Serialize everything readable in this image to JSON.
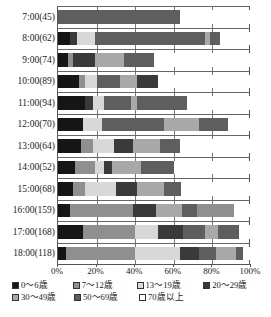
{
  "chart": {
    "type": "bar",
    "title": "",
    "xlabel": "",
    "ylabel": ""
  },
  "axis": {
    "x_ticks": [
      "0%",
      "20%",
      "40%",
      "60%",
      "80%",
      "100%"
    ],
    "x_tick_values": [
      0,
      20,
      40,
      60,
      80,
      100
    ],
    "y_labels": [
      "7:00(45)",
      "8:00(62)",
      "9:00(74)",
      "10:00(89)",
      "11:00(94)",
      "12:00(70)",
      "13:00(64)",
      "14:00(52)",
      "15:00(68)",
      "16:00(159)",
      "17:00(168)",
      "18:00(118)"
    ]
  },
  "legend": {
    "position": "bottom",
    "rows": [
      [
        {
          "label": "0～6歳",
          "color": "#161616"
        },
        {
          "label": "7～12歳",
          "color": "#8f8f8f"
        },
        {
          "label": "13～19歳",
          "color": "#d8d8d8"
        },
        {
          "label": "20～29歳",
          "color": "#3a3a3a"
        }
      ],
      [
        {
          "label": "30～49歳",
          "color": "#a8a8a8"
        },
        {
          "label": "50～69歳",
          "color": "#5e5e5e"
        },
        {
          "label": "70歳以上",
          "color": "#ffffff"
        }
      ]
    ]
  },
  "chart_data": {
    "type": "bar",
    "orientation": "horizontal",
    "stacked": "percent",
    "title": "",
    "xlabel": "",
    "ylabel": "",
    "xlim": [
      0,
      100
    ],
    "grid": true,
    "legend_position": "bottom",
    "categories": [
      "7:00(45)",
      "8:00(62)",
      "9:00(74)",
      "10:00(89)",
      "11:00(94)",
      "12:00(70)",
      "13:00(64)",
      "14:00(52)",
      "15:00(68)",
      "16:00(159)",
      "17:00(168)",
      "18:00(118)"
    ],
    "category_counts": [
      45,
      62,
      74,
      89,
      94,
      70,
      64,
      52,
      68,
      159,
      168,
      118
    ],
    "series": [
      {
        "name": "0～6歳",
        "color": "#161616",
        "values": [
          0,
          5,
          7,
          11,
          14,
          12,
          11,
          8,
          7,
          5,
          12,
          4
        ]
      },
      {
        "name": "7～12歳",
        "color": "#8f8f8f",
        "values": [
          0,
          3,
          0,
          3,
          2,
          0,
          5,
          6,
          5,
          15,
          12,
          23
        ]
      },
      {
        "name": "13～19歳",
        "color": "#d8d8d8",
        "values": [
          0,
          8,
          0,
          7,
          6,
          9,
          10,
          4,
          14,
          0,
          12,
          0
        ]
      },
      {
        "name": "20～29歳",
        "color": "#3a3a3a",
        "values": [
          0,
          0,
          10,
          0,
          4,
          0,
          4,
          4,
          0,
          0,
          0,
          0
        ]
      },
      {
        "name": "30～49歳",
        "color": "#a8a8a8",
        "values": [
          0,
          0,
          15,
          11,
          3,
          0,
          14,
          13,
          13,
          0,
          0,
          10
        ]
      },
      {
        "name": "50～69歳",
        "color": "#5e5e5e",
        "values": [
          70,
          69,
          28,
          28,
          56,
          56,
          10,
          10,
          14,
          40,
          19,
          26
        ]
      },
      {
        "name": "70歳以上",
        "color": "#ffffff",
        "values": [
          30,
          15,
          40,
          40,
          15,
          23,
          46,
          55,
          47,
          40,
          45,
          37
        ]
      }
    ],
    "bars": [
      {
        "category": "7:00(45)",
        "segments": [
          {
            "name": "0～6歳",
            "pct": 0,
            "color": "#161616"
          },
          {
            "name": "7～12歳",
            "pct": 0,
            "color": "#8f8f8f"
          },
          {
            "name": "13～19歳",
            "pct": 0,
            "color": "#d8d8d8"
          },
          {
            "name": "20～29歳",
            "pct": 0,
            "color": "#3a3a3a"
          },
          {
            "name": "30～49歳",
            "pct": 0,
            "color": "#a8a8a8"
          },
          {
            "name": "50～69歳",
            "pct": 63,
            "color": "#5e5e5e"
          },
          {
            "name": "70歳以上",
            "pct": 37,
            "color": "#ffffff"
          }
        ]
      },
      {
        "category": "8:00(62)",
        "segments": [
          {
            "name": "0～6歳",
            "pct": 6,
            "color": "#161616"
          },
          {
            "name": "20～29歳",
            "pct": 4,
            "color": "#3a3a3a"
          },
          {
            "name": "13～19歳",
            "pct": 9,
            "color": "#d8d8d8"
          },
          {
            "name": "50～69歳",
            "pct": 57,
            "color": "#5e5e5e"
          },
          {
            "name": "30～49歳",
            "pct": 3,
            "color": "#a8a8a8"
          },
          {
            "name": "50～69歳",
            "pct": 5,
            "color": "#5e5e5e"
          },
          {
            "name": "70歳以上",
            "pct": 16,
            "color": "#ffffff"
          }
        ]
      },
      {
        "category": "9:00(74)",
        "segments": [
          {
            "name": "0～6歳",
            "pct": 5,
            "color": "#161616"
          },
          {
            "name": "7～12歳",
            "pct": 3,
            "color": "#8f8f8f"
          },
          {
            "name": "20～29歳",
            "pct": 11,
            "color": "#3a3a3a"
          },
          {
            "name": "30～49歳",
            "pct": 15,
            "color": "#a8a8a8"
          },
          {
            "name": "50～69歳",
            "pct": 16,
            "color": "#5e5e5e"
          },
          {
            "name": "70歳以上",
            "pct": 50,
            "color": "#ffffff"
          }
        ]
      },
      {
        "category": "10:00(89)",
        "segments": [
          {
            "name": "0～6歳",
            "pct": 11,
            "color": "#161616"
          },
          {
            "name": "7～12歳",
            "pct": 3,
            "color": "#8f8f8f"
          },
          {
            "name": "13～19歳",
            "pct": 6,
            "color": "#d8d8d8"
          },
          {
            "name": "50～69歳",
            "pct": 12,
            "color": "#5e5e5e"
          },
          {
            "name": "30～49歳",
            "pct": 9,
            "color": "#a8a8a8"
          },
          {
            "name": "20～29歳",
            "pct": 11,
            "color": "#3a3a3a"
          },
          {
            "name": "70歳以上",
            "pct": 48,
            "color": "#ffffff"
          }
        ]
      },
      {
        "category": "11:00(94)",
        "segments": [
          {
            "name": "0～6歳",
            "pct": 14,
            "color": "#161616"
          },
          {
            "name": "20～29歳",
            "pct": 4,
            "color": "#3a3a3a"
          },
          {
            "name": "13～19歳",
            "pct": 6,
            "color": "#d8d8d8"
          },
          {
            "name": "50～69歳",
            "pct": 14,
            "color": "#5e5e5e"
          },
          {
            "name": "30～49歳",
            "pct": 3,
            "color": "#a8a8a8"
          },
          {
            "name": "50～69歳",
            "pct": 26,
            "color": "#5e5e5e"
          },
          {
            "name": "70歳以上",
            "pct": 33,
            "color": "#ffffff"
          }
        ]
      },
      {
        "category": "12:00(70)",
        "segments": [
          {
            "name": "0～6歳",
            "pct": 13,
            "color": "#161616"
          },
          {
            "name": "13～19歳",
            "pct": 10,
            "color": "#d8d8d8"
          },
          {
            "name": "50～69歳",
            "pct": 32,
            "color": "#5e5e5e"
          },
          {
            "name": "30～49歳",
            "pct": 18,
            "color": "#a8a8a8"
          },
          {
            "name": "50～69歳",
            "pct": 15,
            "color": "#5e5e5e"
          },
          {
            "name": "70歳以上",
            "pct": 12,
            "color": "#ffffff"
          }
        ]
      },
      {
        "category": "13:00(64)",
        "segments": [
          {
            "name": "0～6歳",
            "pct": 12,
            "color": "#161616"
          },
          {
            "name": "7～12歳",
            "pct": 6,
            "color": "#8f8f8f"
          },
          {
            "name": "13～19歳",
            "pct": 11,
            "color": "#d8d8d8"
          },
          {
            "name": "20～29歳",
            "pct": 10,
            "color": "#3a3a3a"
          },
          {
            "name": "30～49歳",
            "pct": 14,
            "color": "#a8a8a8"
          },
          {
            "name": "50～69歳",
            "pct": 10,
            "color": "#5e5e5e"
          },
          {
            "name": "70歳以上",
            "pct": 37,
            "color": "#ffffff"
          }
        ]
      },
      {
        "category": "14:00(52)",
        "segments": [
          {
            "name": "0～6歳",
            "pct": 9,
            "color": "#161616"
          },
          {
            "name": "7～12歳",
            "pct": 10,
            "color": "#8f8f8f"
          },
          {
            "name": "13～19歳",
            "pct": 5,
            "color": "#d8d8d8"
          },
          {
            "name": "20～29歳",
            "pct": 4,
            "color": "#3a3a3a"
          },
          {
            "name": "30～49歳",
            "pct": 15,
            "color": "#a8a8a8"
          },
          {
            "name": "50～69歳",
            "pct": 17,
            "color": "#5e5e5e"
          },
          {
            "name": "70歳以上",
            "pct": 40,
            "color": "#ffffff"
          }
        ]
      },
      {
        "category": "15:00(68)",
        "segments": [
          {
            "name": "0～6歳",
            "pct": 8,
            "color": "#161616"
          },
          {
            "name": "7～12歳",
            "pct": 6,
            "color": "#8f8f8f"
          },
          {
            "name": "13～19歳",
            "pct": 16,
            "color": "#d8d8d8"
          },
          {
            "name": "20～29歳",
            "pct": 11,
            "color": "#3a3a3a"
          },
          {
            "name": "30～49歳",
            "pct": 14,
            "color": "#a8a8a8"
          },
          {
            "name": "50～69歳",
            "pct": 9,
            "color": "#5e5e5e"
          },
          {
            "name": "70歳以上",
            "pct": 36,
            "color": "#ffffff"
          }
        ]
      },
      {
        "category": "16:00(159)",
        "segments": [
          {
            "name": "0～6歳",
            "pct": 6,
            "color": "#161616"
          },
          {
            "name": "7～12歳",
            "pct": 33,
            "color": "#8f8f8f"
          },
          {
            "name": "20～29歳",
            "pct": 12,
            "color": "#3a3a3a"
          },
          {
            "name": "30～49歳",
            "pct": 13,
            "color": "#a8a8a8"
          },
          {
            "name": "50～69歳",
            "pct": 8,
            "color": "#5e5e5e"
          },
          {
            "name": "7～12歳",
            "pct": 19,
            "color": "#8f8f8f"
          },
          {
            "name": "70歳以上",
            "pct": 9,
            "color": "#ffffff"
          }
        ]
      },
      {
        "category": "17:00(168)",
        "segments": [
          {
            "name": "0～6歳",
            "pct": 13,
            "color": "#161616"
          },
          {
            "name": "7～12歳",
            "pct": 27,
            "color": "#8f8f8f"
          },
          {
            "name": "13～19歳",
            "pct": 12,
            "color": "#d8d8d8"
          },
          {
            "name": "20～29歳",
            "pct": 13,
            "color": "#3a3a3a"
          },
          {
            "name": "50～69歳",
            "pct": 11,
            "color": "#5e5e5e"
          },
          {
            "name": "30～49歳",
            "pct": 7,
            "color": "#a8a8a8"
          },
          {
            "name": "50～69歳",
            "pct": 11,
            "color": "#5e5e5e"
          },
          {
            "name": "70歳以上",
            "pct": 6,
            "color": "#ffffff"
          }
        ]
      },
      {
        "category": "18:00(118)",
        "segments": [
          {
            "name": "0～6歳",
            "pct": 4,
            "color": "#161616"
          },
          {
            "name": "7～12歳",
            "pct": 36,
            "color": "#8f8f8f"
          },
          {
            "name": "13～19歳",
            "pct": 23,
            "color": "#d8d8d8"
          },
          {
            "name": "20～29歳",
            "pct": 10,
            "color": "#3a3a3a"
          },
          {
            "name": "50～69歳",
            "pct": 9,
            "color": "#5e5e5e"
          },
          {
            "name": "30～49歳",
            "pct": 10,
            "color": "#a8a8a8"
          },
          {
            "name": "50～69歳",
            "pct": 4,
            "color": "#5e5e5e"
          },
          {
            "name": "70歳以上",
            "pct": 4,
            "color": "#ffffff"
          }
        ]
      }
    ]
  }
}
